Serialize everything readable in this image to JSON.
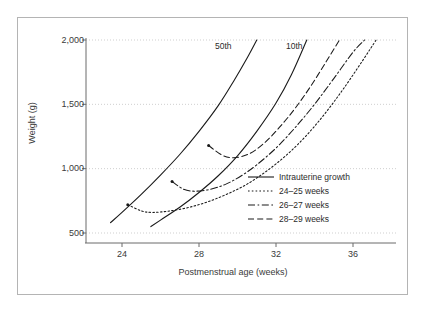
{
  "chart_data": {
    "type": "line",
    "title": "",
    "xlabel": "Postmenstrual age (weeks)",
    "ylabel": "Weight (g)",
    "xlim": [
      22,
      38.5
    ],
    "ylim": [
      430,
      2120
    ],
    "xticks": [
      24,
      28,
      32,
      36
    ],
    "xtick_labels": [
      "24",
      "28",
      "32",
      "36"
    ],
    "yticks": [
      500,
      1000,
      1500,
      2000
    ],
    "ytick_labels": [
      "500",
      "1,000",
      "1,500",
      "2,000"
    ],
    "grid": "horizontal-dotted",
    "legend_position": "center-right",
    "annotations": [
      {
        "text": "50th",
        "x": 29.0,
        "y": 2010
      },
      {
        "text": "10th",
        "x": 32.4,
        "y": 2010
      }
    ],
    "series": [
      {
        "name": "Intrauterine growth 50th percentile",
        "legend_key": "Intrauterine growth",
        "style": "solid",
        "points": [
          [
            23.4,
            580
          ],
          [
            24,
            660
          ],
          [
            25,
            800
          ],
          [
            26,
            950
          ],
          [
            27,
            1110
          ],
          [
            28,
            1290
          ],
          [
            29,
            1490
          ],
          [
            29.8,
            1680
          ],
          [
            30.5,
            1860
          ],
          [
            31.0,
            2000
          ]
        ]
      },
      {
        "name": "Intrauterine growth 10th percentile",
        "legend_key": "Intrauterine growth",
        "style": "solid",
        "points": [
          [
            25.5,
            550
          ],
          [
            26,
            600
          ],
          [
            27,
            700
          ],
          [
            28,
            815
          ],
          [
            29,
            945
          ],
          [
            30,
            1100
          ],
          [
            31,
            1290
          ],
          [
            32,
            1510
          ],
          [
            32.8,
            1730
          ],
          [
            33.6,
            2000
          ]
        ]
      },
      {
        "name": "24-25 weeks",
        "legend_key": "24–25 weeks",
        "style": "dotted",
        "start_marker": [
          24.3,
          720
        ],
        "points": [
          [
            24.3,
            720
          ],
          [
            25.0,
            672
          ],
          [
            25.6,
            660
          ],
          [
            26.5,
            672
          ],
          [
            27.5,
            700
          ],
          [
            28.5,
            745
          ],
          [
            29.5,
            805
          ],
          [
            30.5,
            880
          ],
          [
            31.5,
            980
          ],
          [
            32.5,
            1100
          ],
          [
            33.5,
            1245
          ],
          [
            34.5,
            1420
          ],
          [
            35.5,
            1620
          ],
          [
            36.5,
            1840
          ],
          [
            37.2,
            2000
          ]
        ]
      },
      {
        "name": "26-27 weeks",
        "legend_key": "26–27 weeks",
        "style": "dash-dot",
        "start_marker": [
          26.6,
          900
        ],
        "points": [
          [
            26.6,
            900
          ],
          [
            27.2,
            840
          ],
          [
            27.8,
            825
          ],
          [
            28.6,
            840
          ],
          [
            29.4,
            880
          ],
          [
            30.2,
            945
          ],
          [
            31.0,
            1030
          ],
          [
            32.0,
            1160
          ],
          [
            33.0,
            1320
          ],
          [
            34.0,
            1500
          ],
          [
            35.0,
            1700
          ],
          [
            36.0,
            1905
          ],
          [
            36.6,
            2000
          ]
        ]
      },
      {
        "name": "28-29 weeks",
        "legend_key": "28–29 weeks",
        "style": "dashed",
        "start_marker": [
          28.5,
          1180
        ],
        "points": [
          [
            28.5,
            1180
          ],
          [
            29.2,
            1105
          ],
          [
            29.8,
            1085
          ],
          [
            30.6,
            1115
          ],
          [
            31.4,
            1200
          ],
          [
            32.2,
            1325
          ],
          [
            33.0,
            1470
          ],
          [
            33.8,
            1640
          ],
          [
            34.6,
            1830
          ],
          [
            35.3,
            2000
          ]
        ]
      }
    ]
  },
  "axes": {
    "y_title": "Weight (g)",
    "x_title": "Postmenstrual age (weeks)",
    "y_labels": [
      "2,000",
      "1,500",
      "1,000",
      "500"
    ],
    "x_labels": [
      "24",
      "28",
      "32",
      "36"
    ]
  },
  "annotations": {
    "percentile_50": "50th",
    "percentile_10": "10th"
  },
  "legend": {
    "items": [
      {
        "label": "Intrauterine growth",
        "style": "solid"
      },
      {
        "label": "24–25 weeks",
        "style": "dotted"
      },
      {
        "label": "26–27 weeks",
        "style": "dash-dot"
      },
      {
        "label": "28–29 weeks",
        "style": "dashed"
      }
    ]
  },
  "colors": {
    "line": "#1a1a1a",
    "grid": "#cfcfcf",
    "axis": "#6b6b6b",
    "frame": "#b4b4b4",
    "text": "#3a3a3a",
    "background": "#ffffff"
  }
}
